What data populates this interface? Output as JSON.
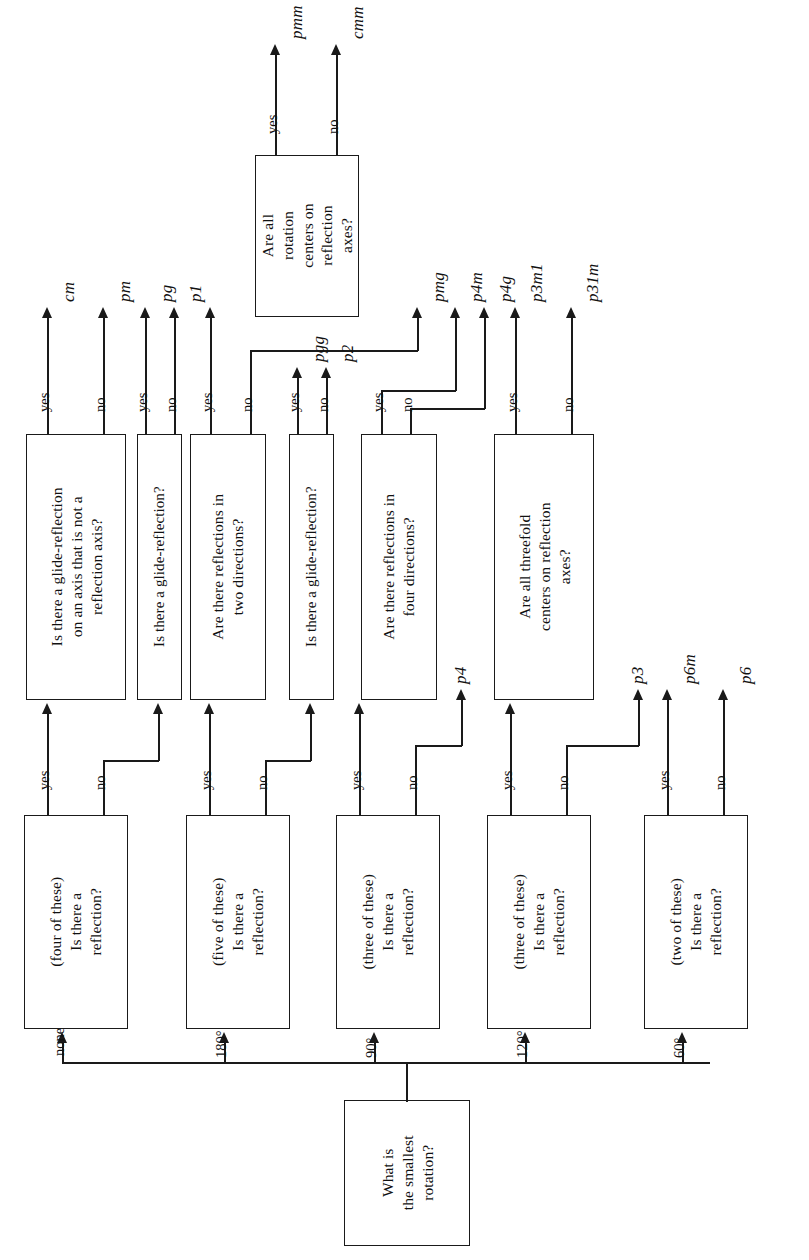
{
  "diagram": {
    "orientation": "rotated-90-ccw",
    "line_color": "#1a1a1a",
    "background": "#ffffff"
  },
  "start": {
    "id": "start",
    "text": "What is\nthe smallest\nrotation?",
    "lines": [
      "What is",
      "the smallest",
      "rotation?"
    ]
  },
  "rotation_edges": [
    {
      "label": "none",
      "to": "q_none"
    },
    {
      "label": "180°",
      "to": "q_180"
    },
    {
      "label": "90°",
      "to": "q_90"
    },
    {
      "label": "120°",
      "to": "q_120"
    },
    {
      "label": "60°",
      "to": "q_60"
    }
  ],
  "reflection_nodes": [
    {
      "id": "q_none",
      "lines": [
        "(four of these)",
        "Is there a",
        "reflection?"
      ]
    },
    {
      "id": "q_180",
      "lines": [
        "(five of these)",
        "Is there a",
        "reflection?"
      ]
    },
    {
      "id": "q_90",
      "lines": [
        "(three of these)",
        "Is there a",
        "reflection?"
      ]
    },
    {
      "id": "q_120",
      "lines": [
        "(three of these)",
        "Is there a",
        "reflection?"
      ]
    },
    {
      "id": "q_60",
      "lines": [
        "(two of these)",
        "Is there a",
        "reflection?"
      ]
    }
  ],
  "second_level_nodes": [
    {
      "id": "n_glide_axis",
      "lines": [
        "Is there a glide-reflection",
        "on an axis that is not a",
        "reflection axis?"
      ]
    },
    {
      "id": "n_glide_1",
      "lines": [
        "Is there a glide-reflection?"
      ]
    },
    {
      "id": "n_refl_two",
      "lines": [
        "Are there reflections in",
        "two directions?"
      ]
    },
    {
      "id": "n_glide_2",
      "lines": [
        "Is there a glide-reflection?"
      ]
    },
    {
      "id": "n_refl_four",
      "lines": [
        "Are there reflections in",
        "four directions?"
      ]
    },
    {
      "id": "n_threefold",
      "lines": [
        "Are all threefold",
        "centers on reflection",
        "axes?"
      ]
    }
  ],
  "third_level_nodes": [
    {
      "id": "n_rot_centers",
      "lines": [
        "Are all",
        "rotation",
        "centers on",
        "reflection",
        "axes?"
      ]
    }
  ],
  "branch_labels": {
    "yes": "yes",
    "no": "no"
  },
  "terminals": [
    {
      "id": "t_cm",
      "label": "cm"
    },
    {
      "id": "t_pm",
      "label": "pm"
    },
    {
      "id": "t_pg",
      "label": "pg"
    },
    {
      "id": "t_p1",
      "label": "p1"
    },
    {
      "id": "t_pmm",
      "label": "pmm"
    },
    {
      "id": "t_cmm",
      "label": "cmm"
    },
    {
      "id": "t_pmg",
      "label": "pmg"
    },
    {
      "id": "t_pgg",
      "label": "pgg"
    },
    {
      "id": "t_p2",
      "label": "p2"
    },
    {
      "id": "t_p4m",
      "label": "p4m"
    },
    {
      "id": "t_p4g",
      "label": "p4g"
    },
    {
      "id": "t_p4",
      "label": "p4"
    },
    {
      "id": "t_p3m1",
      "label": "p3m1"
    },
    {
      "id": "t_p31m",
      "label": "p31m"
    },
    {
      "id": "t_p3",
      "label": "p3"
    },
    {
      "id": "t_p6m",
      "label": "p6m"
    },
    {
      "id": "t_p6",
      "label": "p6"
    }
  ]
}
